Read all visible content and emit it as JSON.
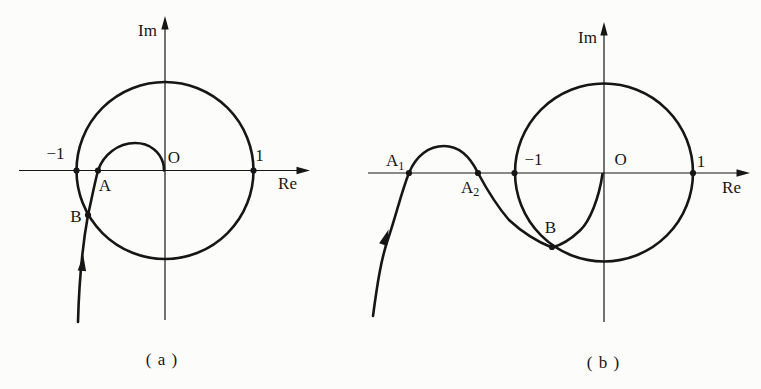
{
  "colors": {
    "ink": "#161616",
    "background": "#fcfcfb"
  },
  "plot_a": {
    "im_axis_label": "Im",
    "re_axis_label": "Re",
    "origin_label": "O",
    "minus_one_label": "−1",
    "plus_one_label": "1",
    "point_a_label": "A",
    "point_b_label": "B",
    "caption": "( a )"
  },
  "plot_b": {
    "im_axis_label": "Im",
    "re_axis_label": "Re",
    "origin_label": "O",
    "minus_one_label": "−1",
    "plus_one_label": "1",
    "point_a1_label": {
      "base": "A",
      "sub": "1"
    },
    "point_a2_label": {
      "base": "A",
      "sub": "2"
    },
    "point_b_label": "B",
    "caption": "( b )"
  }
}
